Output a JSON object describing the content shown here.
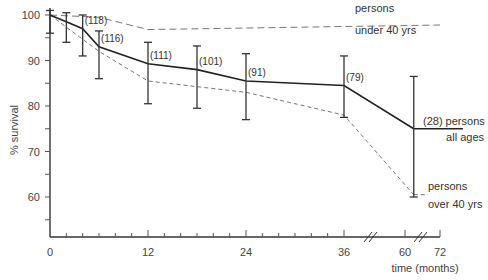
{
  "chart_data": {
    "type": "line",
    "title": "",
    "xlabel": "time (months)",
    "ylabel": "% survival",
    "x_ticks": [
      "0",
      "12",
      "24",
      "36",
      "60",
      "72"
    ],
    "y_ticks": [
      "60",
      "70",
      "80",
      "90",
      "100"
    ],
    "ylim": [
      52,
      101
    ],
    "xlim": [
      0,
      72
    ],
    "axis_breaks": [
      {
        "between": [
          36,
          60
        ]
      },
      {
        "between": [
          60,
          72
        ]
      }
    ],
    "grid": false,
    "legend_position": "inline-right",
    "series": [
      {
        "name": "persons all ages",
        "style": "solid",
        "x": [
          0,
          2,
          4,
          6,
          12,
          18,
          24,
          36,
          63
        ],
        "values": [
          100,
          98.5,
          97,
          93,
          89.3,
          88,
          85.5,
          84.5,
          75
        ],
        "error_low": [
          96,
          94,
          91,
          86,
          80.5,
          79.5,
          77,
          77.5,
          60
        ],
        "error_high": [
          101,
          100.5,
          100,
          96.5,
          94,
          93.2,
          91.5,
          91,
          86.5
        ],
        "n_labels": [
          {
            "x": 4,
            "label": "(118)"
          },
          {
            "x": 6,
            "label": "(116)"
          },
          {
            "x": 12,
            "label": "(111)"
          },
          {
            "x": 18,
            "label": "(101)"
          },
          {
            "x": 24,
            "label": "(91)"
          },
          {
            "x": 36,
            "label": "(79)"
          },
          {
            "x": 63,
            "label": "(28)"
          }
        ]
      },
      {
        "name": "persons under 40 yrs",
        "style": "dashed",
        "x": [
          0,
          6,
          12,
          72
        ],
        "values": [
          100,
          99.5,
          96.8,
          97.8
        ]
      },
      {
        "name": "persons over 40 yrs",
        "style": "dashed",
        "x": [
          0,
          6,
          12,
          24,
          36,
          63
        ],
        "values": [
          100,
          92,
          85.5,
          83,
          78,
          60.5
        ]
      }
    ],
    "annotations": {
      "all_ages": [
        "(28) persons",
        "all ages"
      ],
      "under_40": [
        "persons",
        "under 40 yrs"
      ],
      "over_40": [
        "persons",
        "over 40 yrs"
      ]
    }
  }
}
